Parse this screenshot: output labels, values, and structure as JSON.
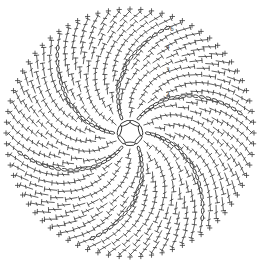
{
  "diagram": {
    "type": "crochet-stitch-chart",
    "shape": "circle",
    "center": [
      130,
      133
    ],
    "outer_radius": 122,
    "background": "#ffffff",
    "ink_color": "#2e2e2e",
    "center_ring": {
      "stitch": "chain",
      "links": 7,
      "radius": 12
    },
    "spiral_arms": {
      "count": 6,
      "stitch": "chain",
      "twist_degrees": 55,
      "start_angle_degrees": -60
    },
    "rounds": 11,
    "stitches_per_round_first": 12,
    "stitches_per_round_increment": 6,
    "main_stitch": "double-crochet",
    "edge_stitch": "single-crochet",
    "round_labels": [
      {
        "text": "2",
        "x": 166,
        "y": 96
      },
      {
        "text": "3",
        "x": 166,
        "y": 72
      },
      {
        "text": "4",
        "x": 166,
        "y": 49
      },
      {
        "text": "6",
        "x": 170,
        "y": 31
      }
    ]
  }
}
